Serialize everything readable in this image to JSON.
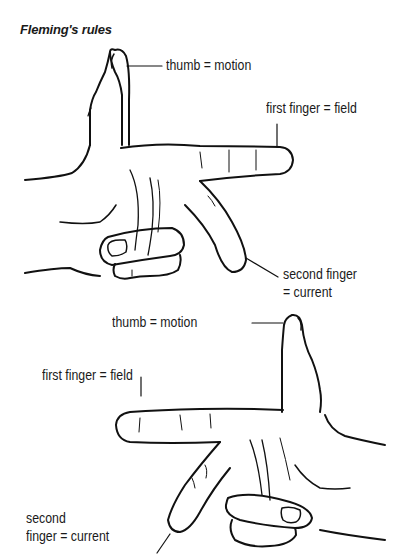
{
  "title": "Fleming's rules",
  "figures": [
    {
      "name": "upper-hand",
      "labels": {
        "thumb": "thumb = motion",
        "first_finger": "first finger = field",
        "second_finger_line1": "second finger",
        "second_finger_line2": "= current"
      }
    },
    {
      "name": "lower-hand",
      "labels": {
        "thumb": "thumb = motion",
        "first_finger": "first finger = field",
        "second_finger_line1": "second",
        "second_finger_line2": "finger = current"
      }
    }
  ],
  "colors": {
    "background": "#ffffff",
    "ink": "#111111"
  }
}
